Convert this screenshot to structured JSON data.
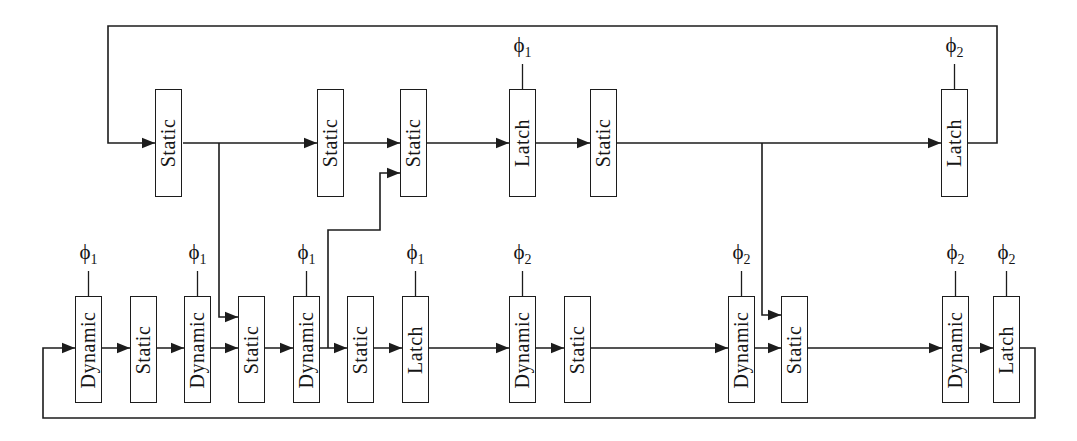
{
  "diagram": {
    "top_row": [
      {
        "label": "Static",
        "clock": null
      },
      {
        "label": "Static",
        "clock": null
      },
      {
        "label": "Static",
        "clock": null
      },
      {
        "label": "Latch",
        "clock": "phi1"
      },
      {
        "label": "Static",
        "clock": null
      },
      {
        "label": "Latch",
        "clock": "phi2"
      }
    ],
    "bottom_row": [
      {
        "label": "Dynamic",
        "clock": "phi1"
      },
      {
        "label": "Static",
        "clock": null
      },
      {
        "label": "Dynamic",
        "clock": "phi1"
      },
      {
        "label": "Static",
        "clock": null
      },
      {
        "label": "Dynamic",
        "clock": "phi1"
      },
      {
        "label": "Static",
        "clock": null
      },
      {
        "label": "Latch",
        "clock": "phi1"
      },
      {
        "label": "Dynamic",
        "clock": "phi2"
      },
      {
        "label": "Static",
        "clock": null
      },
      {
        "label": "Dynamic",
        "clock": "phi2"
      },
      {
        "label": "Static",
        "clock": null
      },
      {
        "label": "Dynamic",
        "clock": "phi2"
      },
      {
        "label": "Latch",
        "clock": "phi2"
      }
    ],
    "clock_symbols": {
      "phi1": {
        "base": "ϕ",
        "sub": "1"
      },
      "phi2": {
        "base": "ϕ",
        "sub": "2"
      }
    },
    "colors": {
      "line": "#1c1c1c",
      "background": "#ffffff",
      "block_fill": "#ffffff"
    }
  }
}
